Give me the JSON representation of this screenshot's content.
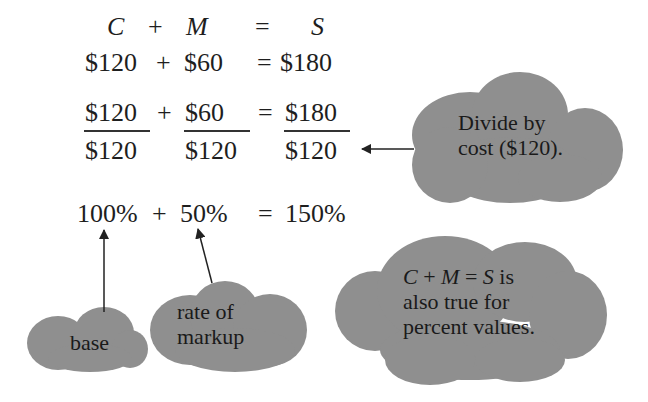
{
  "colors": {
    "text": "#1e1e1e",
    "cloud_fill": "#8f8f8f",
    "arrow": "#222222",
    "background": "#ffffff"
  },
  "formula": {
    "header": {
      "c": "C",
      "plus": "+",
      "m": "M",
      "equals": "=",
      "s": "S"
    },
    "dollar_row": {
      "cost": "$120",
      "plus": "+",
      "markup": "$60",
      "equals": "=",
      "selling": "$180"
    },
    "fraction_row": {
      "cost_num": "$120",
      "cost_den": "$120",
      "plus": "+",
      "markup_num": "$60",
      "markup_den": "$120",
      "equals": "=",
      "selling_num": "$180",
      "selling_den": "$120"
    },
    "percent_row": {
      "base": "100%",
      "plus": "+",
      "rate": "50%",
      "equals": "=",
      "result": "150%"
    }
  },
  "callouts": {
    "divide": {
      "line1": "Divide by",
      "line2": "cost ($120)."
    },
    "base": {
      "line1": "base"
    },
    "rate": {
      "line1": "rate of",
      "line2": "markup"
    },
    "percent_note": {
      "eq_c": "C",
      "eq_plus": "+",
      "eq_m": "M",
      "eq_equals": "=",
      "eq_s": "S",
      "eq_tail": "is",
      "line2": "also true for",
      "line3": "percent values."
    }
  }
}
